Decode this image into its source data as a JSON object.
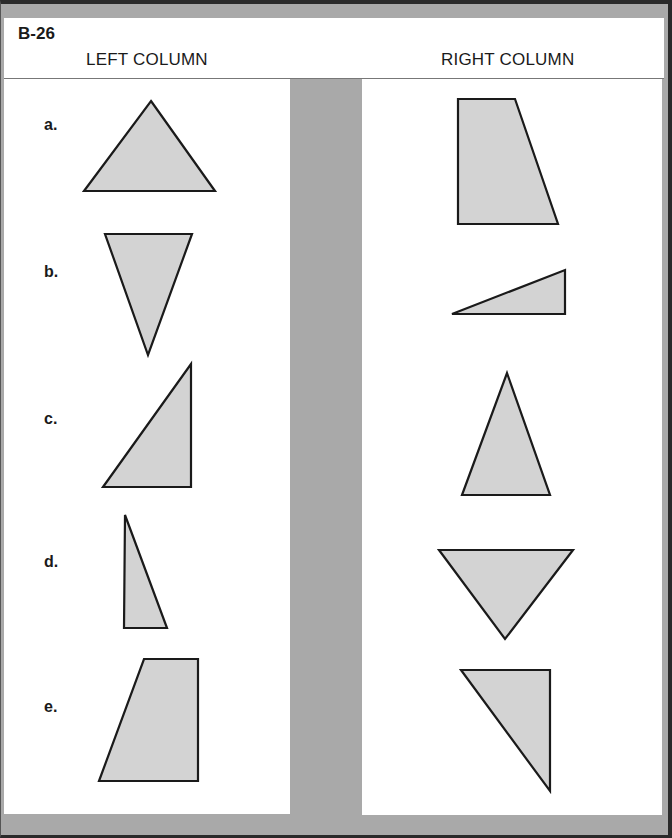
{
  "worksheet": {
    "code": "B-26",
    "left_column_title": "LEFT COLUMN",
    "right_column_title": "RIGHT COLUMN"
  },
  "left_column": {
    "items": [
      {
        "label": "a.",
        "shape": "acute-triangle-pointing-up"
      },
      {
        "label": "b.",
        "shape": "acute-triangle-pointing-down"
      },
      {
        "label": "c.",
        "shape": "right-triangle"
      },
      {
        "label": "d.",
        "shape": "narrow-right-triangle"
      },
      {
        "label": "e.",
        "shape": "trapezoid"
      }
    ]
  },
  "right_column": {
    "items": [
      {
        "shape": "trapezoid"
      },
      {
        "shape": "flat-right-triangle"
      },
      {
        "shape": "tall-triangle-pointing-up"
      },
      {
        "shape": "triangle-pointing-down"
      },
      {
        "shape": "right-triangle-inverted"
      }
    ]
  },
  "colors": {
    "frame": "#a9a9a9",
    "shape_fill": "#d3d3d3",
    "shape_stroke": "#1a1a1a"
  }
}
